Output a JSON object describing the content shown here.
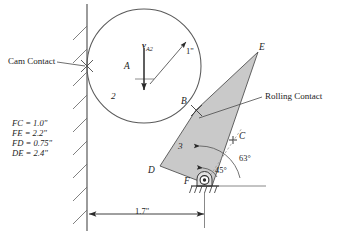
{
  "figure": {
    "stroke_color": "#3a3a3a",
    "fill_color": "#c9c9c9",
    "background": "#ffffff"
  },
  "callouts": {
    "cam_contact": "Cam Contact",
    "rolling_contact": "Rolling Contact"
  },
  "dimensions_block": {
    "lines": [
      "FC = 1.0\"",
      "FE = 2.2\"",
      "FD = 0.75\"",
      "DE = 2.4\""
    ]
  },
  "points": {
    "A": "A",
    "B": "B",
    "C": "C",
    "D": "D",
    "E": "E",
    "F": "F"
  },
  "bodies": {
    "cam": "2",
    "link": "3"
  },
  "vectors": {
    "velocity_symbol": "v",
    "velocity_subscript": "A2"
  },
  "dimension_labels": {
    "radius": "1\"",
    "horizontal": "1.7\""
  },
  "angles": {
    "inner": "45°",
    "outer": "63°"
  },
  "icons": {
    "pin_support": "pin-support-icon",
    "ground_hatch": "ground-hatching-icon",
    "wall_hatch": "wall-hatching-icon"
  }
}
